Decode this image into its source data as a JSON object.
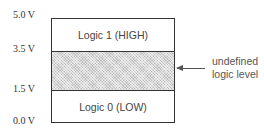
{
  "y_axis_labels": [
    "5.0 V",
    "3.5 V",
    "1.5 V",
    "0.0 V"
  ],
  "zones": {
    "high": "Logic 1 (HIGH)",
    "undefined": "",
    "low": "Logic 0 (LOW)"
  },
  "annotation": {
    "line1": "undefined",
    "line2": "logic level"
  },
  "colors": {
    "border": "#333333",
    "hatch": "#d8d8d8"
  }
}
